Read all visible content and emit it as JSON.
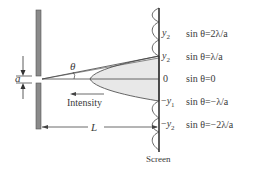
{
  "diagram": {
    "type": "single-slit diffraction",
    "labels": {
      "theta": "θ",
      "slit_width": "a",
      "intensity": "Intensity",
      "distance": "L",
      "screen": "Screen"
    },
    "screen_positions": [
      {
        "pos": "y",
        "sub": "2",
        "sign": "",
        "condition": "sin θ=2λ/a"
      },
      {
        "pos": "y",
        "sub": "2",
        "sign": "",
        "condition": "sin θ=λ/a"
      },
      {
        "pos": "0",
        "sub": "",
        "sign": "",
        "condition": "sin θ=0"
      },
      {
        "pos": "y",
        "sub": "1",
        "sign": "−",
        "condition": "sin θ=−λ/a"
      },
      {
        "pos": "y",
        "sub": "2",
        "sign": "−",
        "condition": "sin θ=−2λ/a"
      }
    ],
    "colors": {
      "line": "#3a3a3a",
      "barrier": "#8a8a8a",
      "fill": "#e8e8e8"
    }
  }
}
